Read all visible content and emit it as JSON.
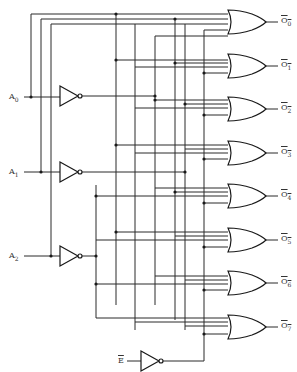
{
  "diagram": {
    "type": "3-to-8 line decoder with active-low enable (OR-gate implementation)",
    "inputs": [
      {
        "name": "A0",
        "label": "A",
        "sub": "0"
      },
      {
        "name": "A1",
        "label": "A",
        "sub": "1"
      },
      {
        "name": "A2",
        "label": "A",
        "sub": "2"
      },
      {
        "name": "E_bar",
        "label": "E",
        "overbar": true
      }
    ],
    "outputs": [
      {
        "label": "O",
        "sub": "0",
        "overbar": true
      },
      {
        "label": "O",
        "sub": "1",
        "overbar": true
      },
      {
        "label": "O",
        "sub": "2",
        "overbar": true
      },
      {
        "label": "O",
        "sub": "3",
        "overbar": true
      },
      {
        "label": "O",
        "sub": "4",
        "overbar": true
      },
      {
        "label": "O",
        "sub": "5",
        "overbar": true
      },
      {
        "label": "O",
        "sub": "6",
        "overbar": true
      },
      {
        "label": "O",
        "sub": "7",
        "overbar": true
      }
    ],
    "components": {
      "inverters": 4,
      "or_gates": 8,
      "or_gate_inputs": 4
    },
    "colors": {
      "line": "#2a2a2a",
      "background": "#ffffff"
    }
  }
}
